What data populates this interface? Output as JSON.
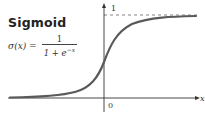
{
  "title": "Sigmoid",
  "formula": {
    "lhs": "σ(x) =",
    "numerator": "1",
    "denominator_base": "1 + e",
    "denominator_exp": "−x"
  },
  "plot": {
    "y_asymptote_label": "1",
    "origin_label": "0",
    "x_axis_label": "x",
    "colors": {
      "curve": "#5a5a5a",
      "axis": "#333333",
      "asymptote": "#666666"
    }
  }
}
